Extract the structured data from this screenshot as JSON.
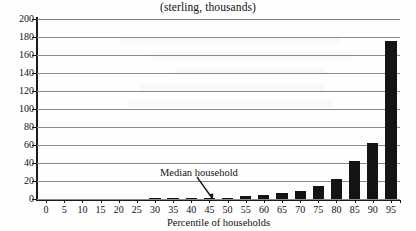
{
  "chart_data": {
    "type": "bar",
    "title": "(sterling, thousands)",
    "xlabel": "Percentile of households",
    "ylabel": "",
    "categories": [
      "0",
      "5",
      "10",
      "15",
      "20",
      "25",
      "30",
      "35",
      "40",
      "45",
      "50",
      "55",
      "60",
      "65",
      "70",
      "75",
      "80",
      "85",
      "90",
      "95"
    ],
    "values": [
      0,
      0,
      0,
      0,
      0,
      0,
      0.2,
      0.4,
      0.8,
      1.0,
      1.4,
      3.0,
      4.2,
      6.4,
      9.4,
      14.0,
      22.0,
      42.0,
      62.0,
      176.0
    ],
    "xlim": [
      0,
      100
    ],
    "ylim": [
      0,
      200
    ],
    "yticks": [
      0,
      20,
      40,
      60,
      80,
      100,
      120,
      140,
      160,
      180,
      200
    ],
    "xticks": [
      "0",
      "5",
      "10",
      "15",
      "20",
      "25",
      "30",
      "35",
      "40",
      "45",
      "50",
      "55",
      "60",
      "65",
      "70",
      "75",
      "80",
      "85",
      "90",
      "95"
    ],
    "grid": "horizontal",
    "legend": null,
    "bar_color": "#141414",
    "grid_color": "#8a8a8a",
    "axis_color": "#1a1a1a",
    "annotations": [
      {
        "text": "Median household",
        "points_to_category": "50",
        "arrow": "down-right"
      }
    ]
  }
}
